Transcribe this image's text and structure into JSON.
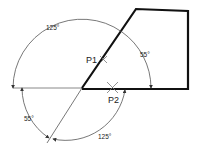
{
  "diagram": {
    "angles": {
      "upper_left": "125°",
      "upper_right": "55°",
      "lower_left": "55°",
      "lower_right": "125°"
    },
    "points": {
      "p1": "P1",
      "p2": "P2"
    },
    "colors": {
      "shape": "#111111",
      "construction": "#555555",
      "baseline": "#888888"
    }
  }
}
